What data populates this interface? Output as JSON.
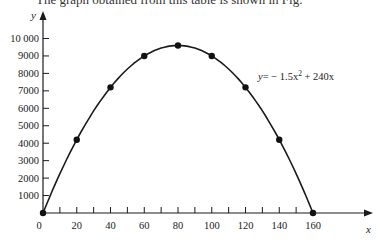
{
  "page": {
    "clipped_caption": "The graph obtained from this table is shown in Fig."
  },
  "chart_data": {
    "type": "line",
    "title": "",
    "xlabel": "x",
    "ylabel": "y",
    "x": [
      0,
      20,
      40,
      60,
      80,
      100,
      120,
      140,
      160
    ],
    "series": [
      {
        "name": "y = −1.5x² + 240x",
        "values": [
          0,
          4200,
          7200,
          9000,
          9600,
          9000,
          7200,
          4200,
          0
        ],
        "markers": true,
        "smooth": true
      }
    ],
    "x_tick_labels": [
      "0",
      "20",
      "40",
      "60",
      "80",
      "100",
      "120",
      "140",
      "160"
    ],
    "x_minor_tick_step": 10,
    "y_tick_labels": [
      "1000",
      "2000",
      "3000",
      "4000",
      "5000",
      "6000",
      "7000",
      "8000",
      "9000",
      "10 000"
    ],
    "y_ticks": [
      1000,
      2000,
      3000,
      4000,
      5000,
      6000,
      7000,
      8000,
      9000,
      10000
    ],
    "xlim": [
      0,
      170
    ],
    "ylim": [
      0,
      10500
    ],
    "grid": false,
    "legend": "none",
    "annotations": [
      {
        "text": "y = −1.5x² + 240x",
        "position": "right of curve near x=105, y≈8000"
      }
    ],
    "equation_label": {
      "y": "y",
      "eq": "= − 1.5x",
      "sup": "2",
      "rest": " + 240x"
    }
  }
}
